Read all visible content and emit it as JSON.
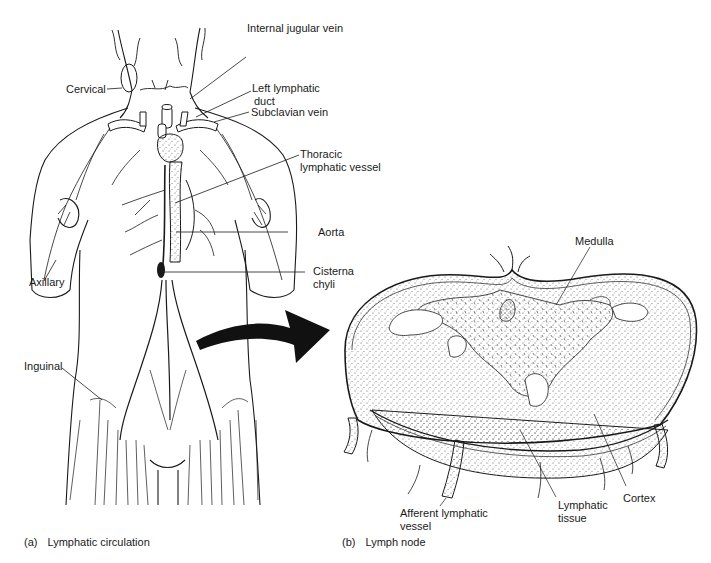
{
  "panel_a": {
    "caption_tag": "(a)",
    "caption": "Lymphatic circulation",
    "labels": {
      "internal_jugular_vein": "Internal jugular vein",
      "left_lymphatic_duct_1": "Left lymphatic",
      "left_lymphatic_duct_2": "duct",
      "subclavian_vein": "Subclavian vein",
      "cervical": "Cervical",
      "thoracic_1": "Thoracic",
      "thoracic_2": "lymphatic vessel",
      "aorta": "Aorta",
      "cisterna_1": "Cisterna",
      "cisterna_2": "chyli",
      "axillary": "Axillary",
      "inguinal": "Inguinal"
    }
  },
  "panel_b": {
    "caption_tag": "(b)",
    "caption": "Lymph node",
    "labels": {
      "medulla": "Medulla",
      "afferent_1": "Afferent lymphatic",
      "afferent_2": "vessel",
      "lymphatic_tissue_1": "Lymphatic",
      "lymphatic_tissue_2": "tissue",
      "cortex": "Cortex"
    }
  },
  "colors": {
    "ink": "#1a1a1a",
    "background": "#ffffff",
    "stipple": "#555555"
  }
}
